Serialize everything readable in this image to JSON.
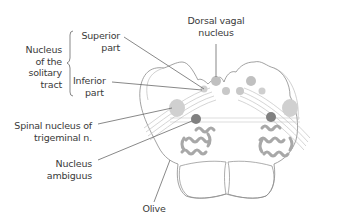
{
  "diagram": {
    "labels": {
      "group": {
        "line1": "Nucleus",
        "line2": "of the",
        "line3": "solitary",
        "line4": "tract"
      },
      "superior": {
        "line1": "Superior",
        "line2": "part"
      },
      "inferior": {
        "line1": "Inferior",
        "line2": "part"
      },
      "dorsal_vagal": {
        "line1": "Dorsal vagal",
        "line2": "nucleus"
      },
      "spinal_trigeminal": {
        "line1": "Spinal nucleus of",
        "line2": "trigeminal n."
      },
      "ambiguus": {
        "line1": "Nucleus",
        "line2": "ambiguus"
      },
      "olive": {
        "line1": "Olive"
      }
    },
    "colors": {
      "outline": "#8a8a8a",
      "leader": "#555555",
      "nucleus_light": "#c4c4c4",
      "nucleus_dark": "#7a7a7a",
      "olive": "#a8a8a8",
      "text": "#3a3a3a"
    }
  }
}
